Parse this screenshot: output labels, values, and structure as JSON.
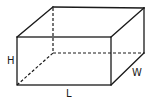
{
  "diagram": {
    "type": "rectangular-prism",
    "labels": {
      "height": "H",
      "length": "L",
      "width": "W"
    },
    "colors": {
      "stroke": "#1a1a1a",
      "background": "#ffffff"
    }
  }
}
